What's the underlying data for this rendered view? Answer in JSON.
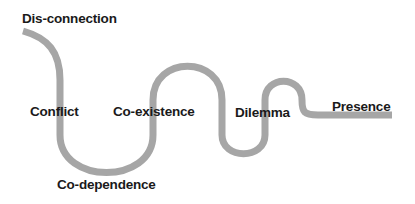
{
  "diagram": {
    "path_color": "#a6a6a6",
    "text_color": "#1a1a1a",
    "stages": [
      {
        "label": "Dis-connection"
      },
      {
        "label": "Conflict"
      },
      {
        "label": "Co-dependence"
      },
      {
        "label": "Co-existence"
      },
      {
        "label": "Dilemma"
      },
      {
        "label": "Presence"
      }
    ]
  }
}
